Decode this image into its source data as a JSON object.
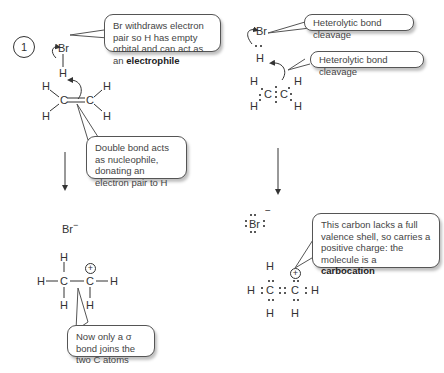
{
  "step_number": "1",
  "left_panel": {
    "reactant": {
      "hbr": {
        "br": "Br",
        "h": "H"
      },
      "ethene": {
        "c1": "C",
        "c2": "C",
        "h_top_left": "H",
        "h_bottom_left": "H",
        "h_top_right": "H",
        "h_bottom_right": "H"
      }
    },
    "callout_electrophile": {
      "text": "Br withdraws electron pair so H has empty orbital and can act as an ",
      "bold": "electrophile"
    },
    "callout_nucleophile": {
      "text": "Double bond acts as nucleophile, donating an electron pair to H"
    },
    "product": {
      "bromide": "Br",
      "bromide_charge": "−",
      "carbocation": {
        "c1": "C",
        "c2": "C",
        "h_top": "H",
        "h_left": "H",
        "h_right": "H",
        "h_bottom_left": "H",
        "h_bottom_right": "H",
        "charge": "+"
      }
    },
    "callout_sigma": {
      "text": "Now only a σ bond joins the two C atoms"
    }
  },
  "right_panel": {
    "reactant": {
      "br": "Br",
      "h": "H",
      "ethene": {
        "c1": "C",
        "c2": "C",
        "h_top_left": "H",
        "h_bottom_left": "H",
        "h_top_right": "H",
        "h_bottom_right": "H"
      }
    },
    "callout_cleavage_1": {
      "text": "Heterolytic bond cleavage"
    },
    "callout_cleavage_2": {
      "text": "Heterolytic bond cleavage"
    },
    "product": {
      "bromide": "Br",
      "bromide_charge": "−",
      "carbocation": {
        "c1": "C",
        "c2": "C",
        "h_top": "H",
        "h_left": "H",
        "h_right": "H",
        "h_bottom_left": "H",
        "h_bottom_right": "H",
        "charge": "+"
      }
    },
    "callout_carbocation": {
      "text": "This carbon lacks a full valence shell, so carries a positive charge: the molecule is a ",
      "bold": "carbocation"
    }
  }
}
